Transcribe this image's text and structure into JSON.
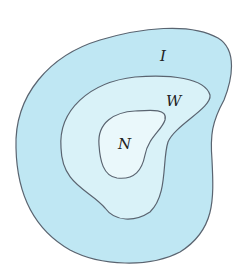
{
  "diagram": {
    "type": "nested-regions",
    "regions": [
      {
        "id": "I",
        "label": "I",
        "fill": "#bfe7f3",
        "stroke": "#5a6470"
      },
      {
        "id": "W",
        "label": "W",
        "fill": "#d9f2f8",
        "stroke": "#5a6470"
      },
      {
        "id": "N",
        "label": "N",
        "fill": "#eaf8fb",
        "stroke": "#5a6470"
      }
    ]
  }
}
